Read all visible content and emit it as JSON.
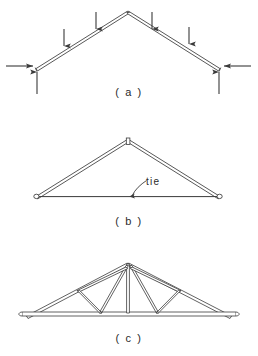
{
  "figure": {
    "background_color": "#ffffff",
    "line_color": "#3a3a3a",
    "text_color": "#2b2b2b"
  },
  "panels": [
    {
      "id": "a",
      "caption": "( a )",
      "description": "Two rafters meeting at a ridge with downward roof loads and support reactions",
      "geometry": {
        "apex": [
          128,
          11
        ],
        "left_support": [
          36,
          68
        ],
        "right_support": [
          220,
          68
        ],
        "member_thickness": 3.2
      },
      "load_arrows": [
        {
          "name": "roof-load-left-outer",
          "x": 64,
          "tail_y": 29,
          "head_y": 46,
          "direction": "down"
        },
        {
          "name": "roof-load-left-inner",
          "x": 96,
          "tail_y": 12,
          "head_y": 29,
          "direction": "down"
        },
        {
          "name": "roof-load-right-inner",
          "x": 152,
          "tail_y": 12,
          "head_y": 29,
          "direction": "down"
        },
        {
          "name": "roof-load-right-outer",
          "x": 189,
          "tail_y": 27,
          "head_y": 44,
          "direction": "down"
        }
      ],
      "reaction_arrows": [
        {
          "name": "left-horizontal-thrust",
          "tail_x": 6,
          "head_x": 33,
          "y": 66,
          "direction": "right"
        },
        {
          "name": "left-vertical-reaction",
          "x": 37,
          "tail_y": 94,
          "head_y": 72,
          "direction": "up"
        },
        {
          "name": "right-horizontal-thrust",
          "tail_x": 251,
          "head_x": 224,
          "y": 66,
          "direction": "left"
        },
        {
          "name": "right-vertical-reaction",
          "x": 219,
          "tail_y": 94,
          "head_y": 72,
          "direction": "up"
        }
      ]
    },
    {
      "id": "b",
      "caption": "( b )",
      "description": "Rafters restrained by a horizontal tie at eaves level forming a simple triangular truss",
      "geometry": {
        "apex": [
          128,
          22
        ],
        "left_support": [
          36,
          78
        ],
        "right_support": [
          220,
          78
        ],
        "member_thickness": 3.2
      },
      "annotation": {
        "label": "tie",
        "label_x": 146,
        "label_y": 58,
        "leader_from": [
          144,
          66
        ],
        "leader_to": [
          132,
          78
        ]
      },
      "joints": [
        "left-pin-joint",
        "right-pin-joint",
        "ridge-joint"
      ]
    },
    {
      "id": "c",
      "caption": "( c )",
      "description": "Completed truss with king post, struts and hangers subdividing rafters and tie",
      "geometry": {
        "apex": [
          128,
          18
        ],
        "left_support": [
          26,
          72
        ],
        "right_support": [
          232,
          72
        ],
        "tie_y": 68,
        "member_thickness": 2.6
      },
      "web_members": [
        {
          "name": "king-post",
          "from": [
            128,
            18
          ],
          "to": [
            128,
            68
          ]
        },
        {
          "name": "left-strut-inner",
          "from": [
            128,
            20
          ],
          "to": [
            100,
            68
          ]
        },
        {
          "name": "left-strut-outer",
          "from": [
            128,
            20
          ],
          "to": [
            78,
            44
          ]
        },
        {
          "name": "left-hanger",
          "from": [
            78,
            44
          ],
          "to": [
            100,
            68
          ]
        },
        {
          "name": "right-strut-inner",
          "from": [
            128,
            20
          ],
          "to": [
            156,
            68
          ]
        },
        {
          "name": "right-strut-outer",
          "from": [
            128,
            20
          ],
          "to": [
            178,
            44
          ]
        },
        {
          "name": "right-hanger",
          "from": [
            178,
            44
          ],
          "to": [
            156,
            68
          ]
        }
      ]
    }
  ]
}
